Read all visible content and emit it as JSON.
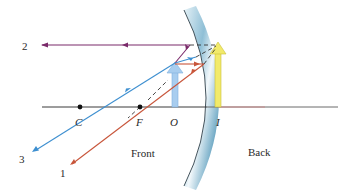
{
  "figure": {
    "type": "convex-mirror-ray-diagram",
    "labels": {
      "ray_1": "1",
      "ray_2": "2",
      "ray_3": "3",
      "center_of_curvature": "C",
      "focal_point": "F",
      "object": "O",
      "image": "I",
      "front_side": "Front",
      "back_side": "Back"
    },
    "colors": {
      "axis": "#3a3a3a",
      "ray_1": "#c8553a",
      "ray_2": "#7a2a6a",
      "ray_3": "#3d8fd0",
      "object_arrow": "#a8cdef",
      "image_arrow": "#f2ea6a",
      "mirror_light": "#e3f0f6",
      "mirror_dark": "#6aa6c2",
      "dashed": "#333333"
    }
  }
}
